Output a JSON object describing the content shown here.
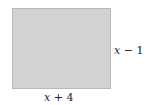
{
  "figure": {
    "shape": "rectangle",
    "fill_color": "#d2d2d2",
    "side_label": {
      "variable": "x",
      "rest": " − 1"
    },
    "bottom_label": {
      "variable": "x",
      "rest": " + 4"
    }
  }
}
